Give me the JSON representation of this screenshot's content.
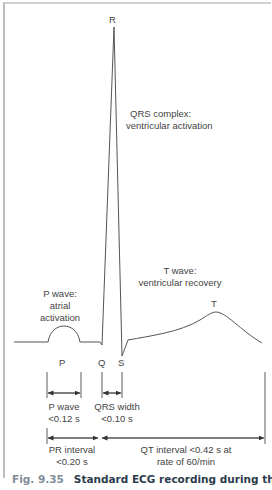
{
  "figure": {
    "labels": {
      "R": "R",
      "T": "T",
      "P": "P",
      "Q": "Q",
      "S": "S",
      "qrs_complex_line1": "QRS complex:",
      "qrs_complex_line2": "ventricular activation",
      "t_wave_line1": "T wave:",
      "t_wave_line2": "ventricular recovery",
      "p_wave_line1": "P wave:",
      "p_wave_line2": "atrial",
      "p_wave_line3": "activation",
      "p_wave_dur_line1": "P wave",
      "p_wave_dur_line2": "<0.12 s",
      "qrs_width_line1": "QRS width",
      "qrs_width_line2": "<0.10 s",
      "pr_interval_line1": "PR interval",
      "pr_interval_line2": "<0.20 s",
      "qt_interval_line1": "QT interval <0.42 s at",
      "qt_interval_line2": "rate of 60/min"
    },
    "colors": {
      "trace": "#555555",
      "text": "#444444",
      "caption_number": "#7f8c99",
      "caption_title": "#2b3b4b",
      "frame": "#bdbdbd"
    }
  },
  "caption": {
    "number": "Fig. 9.35",
    "title": "Standard ECG recording during the timing"
  }
}
